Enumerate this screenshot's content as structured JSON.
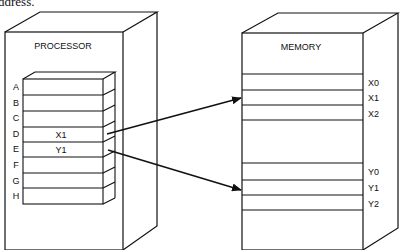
{
  "caption_fragment": "ddress.",
  "processor": {
    "title": "PROCESSOR",
    "registers": [
      {
        "name": "A",
        "value": ""
      },
      {
        "name": "B",
        "value": ""
      },
      {
        "name": "C",
        "value": ""
      },
      {
        "name": "D",
        "value": "X1"
      },
      {
        "name": "E",
        "value": "Y1"
      },
      {
        "name": "F",
        "value": ""
      },
      {
        "name": "G",
        "value": ""
      },
      {
        "name": "H",
        "value": ""
      }
    ]
  },
  "memory": {
    "title": "MEMORY",
    "cells_x": [
      "X0",
      "X1",
      "X2"
    ],
    "cells_y": [
      "Y0",
      "Y1",
      "Y2"
    ]
  },
  "arrows": [
    {
      "from": "D",
      "to": "X1"
    },
    {
      "from": "E",
      "to": "Y1"
    }
  ],
  "colors": {
    "stroke": "#111111",
    "background": "#ffffff"
  }
}
